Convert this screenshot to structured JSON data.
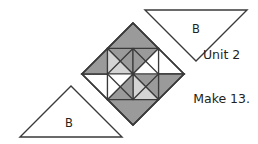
{
  "figure": {
    "kind": "quilt-block-piecing-diagram",
    "background_color": "#ffffff",
    "outline_color": "#3a3a3a",
    "shade_dark": "#9a9a9a",
    "shade_light": "#d4d4d4",
    "shade_white": "#ffffff"
  },
  "caption": {
    "unit_label": "Unit 2",
    "make_label": "Make 13."
  },
  "triangles": {
    "top_right": {
      "label": "B",
      "orientation": "points-down",
      "fill": "#ffffff"
    },
    "bottom_left": {
      "label": "B",
      "orientation": "points-up",
      "fill": "#ffffff"
    }
  },
  "block": {
    "name": "pinwheel-on-point",
    "center_x": 133,
    "center_y": 74,
    "half_diagonal": 51,
    "patches": [
      {
        "name": "corner-top",
        "fill": "#9a9a9a"
      },
      {
        "name": "corner-right",
        "fill": "#9a9a9a"
      },
      {
        "name": "corner-bottom",
        "fill": "#9a9a9a"
      },
      {
        "name": "corner-left",
        "fill": "#9a9a9a"
      },
      {
        "name": "vane-upper-left",
        "fill": "#d4d4d4"
      },
      {
        "name": "vane-upper-right",
        "fill": "#ffffff"
      },
      {
        "name": "vane-lower-right",
        "fill": "#d4d4d4"
      },
      {
        "name": "vane-lower-left",
        "fill": "#ffffff"
      }
    ]
  }
}
